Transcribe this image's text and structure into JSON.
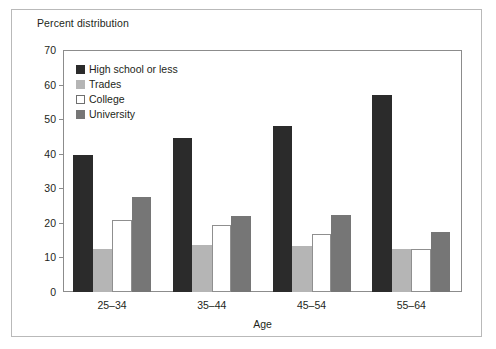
{
  "figure": {
    "caption": "Percent distribution",
    "frame_color": "#b9b9b9",
    "background": "#ffffff"
  },
  "chart_data": {
    "type": "bar",
    "title": "Percent distribution",
    "xlabel": "Age",
    "ylabel": "",
    "categories": [
      "25–34",
      "35–44",
      "45–54",
      "55–64"
    ],
    "series": [
      {
        "name": "High school or less",
        "color": "#2b2b2b",
        "values": [
          39.5,
          44.5,
          48.0,
          57.0
        ]
      },
      {
        "name": "Trades",
        "color": "#b5b5b5",
        "values": [
          12.3,
          13.7,
          13.3,
          12.5
        ]
      },
      {
        "name": "College",
        "color": "#ffffff",
        "values": [
          20.7,
          19.5,
          16.7,
          12.4
        ]
      },
      {
        "name": "University",
        "color": "#767676",
        "values": [
          27.5,
          22.0,
          22.3,
          17.5
        ]
      }
    ],
    "ylim": [
      0,
      70
    ],
    "yticks": [
      0,
      10,
      20,
      30,
      40,
      50,
      60,
      70
    ],
    "ytick_labels": [
      "0",
      "10",
      "20",
      "30",
      "40",
      "50",
      "60",
      "70"
    ],
    "grid": false,
    "legend_position": "upper-left-inside"
  }
}
